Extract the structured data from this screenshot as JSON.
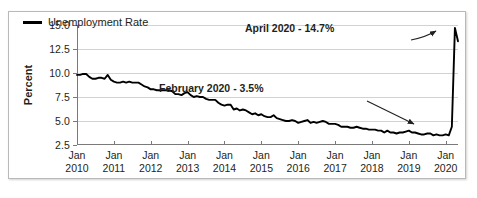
{
  "figure": {
    "legend": {
      "label": "Unemployment Rate",
      "swatch_color": "#000000"
    },
    "annotations": [
      {
        "id": "april",
        "text": "April 2020 - 14.7%"
      },
      {
        "id": "february",
        "text": "February 2020 - 3.5%"
      }
    ]
  },
  "chart_data": {
    "type": "line",
    "title": "",
    "xlabel": "",
    "ylabel": "Percent",
    "ylim": [
      2.5,
      15.0
    ],
    "yticks": [
      2.5,
      5.0,
      7.5,
      10.0,
      12.5,
      15.0
    ],
    "ytick_labels": [
      "2.5",
      "5.0",
      "7.5",
      "10.0",
      "12.5",
      "15.0"
    ],
    "grid": true,
    "legend_position": "top-left",
    "xtick_labels": [
      "Jan\n2010",
      "Jan\n2011",
      "Jan\n2012",
      "Jan\n2013",
      "Jan\n2014",
      "Jan\n2015",
      "Jan\n2016",
      "Jan\n2017",
      "Jan\n2018",
      "Jan\n2019",
      "Jan\n2020"
    ],
    "xticks_month": [
      "Jan",
      "Jan",
      "Jan",
      "Jan",
      "Jan",
      "Jan",
      "Jan",
      "Jan",
      "Jan",
      "Jan",
      "Jan"
    ],
    "xticks_year": [
      "2010",
      "2011",
      "2012",
      "2013",
      "2014",
      "2015",
      "2016",
      "2017",
      "2018",
      "2019",
      "2020"
    ],
    "xlim": [
      "2010-01",
      "2020-05"
    ],
    "annotations": [
      {
        "text": "April 2020 - 14.7%",
        "point": {
          "x": "2020-04",
          "y": 14.7
        }
      },
      {
        "text": "February 2020 - 3.5%",
        "point": {
          "x": "2020-02",
          "y": 3.5
        }
      }
    ],
    "series": [
      {
        "name": "Unemployment Rate",
        "color": "#000000",
        "x": [
          "2010-01",
          "2010-02",
          "2010-03",
          "2010-04",
          "2010-05",
          "2010-06",
          "2010-07",
          "2010-08",
          "2010-09",
          "2010-10",
          "2010-11",
          "2010-12",
          "2011-01",
          "2011-02",
          "2011-03",
          "2011-04",
          "2011-05",
          "2011-06",
          "2011-07",
          "2011-08",
          "2011-09",
          "2011-10",
          "2011-11",
          "2011-12",
          "2012-01",
          "2012-02",
          "2012-03",
          "2012-04",
          "2012-05",
          "2012-06",
          "2012-07",
          "2012-08",
          "2012-09",
          "2012-10",
          "2012-11",
          "2012-12",
          "2013-01",
          "2013-02",
          "2013-03",
          "2013-04",
          "2013-05",
          "2013-06",
          "2013-07",
          "2013-08",
          "2013-09",
          "2013-10",
          "2013-11",
          "2013-12",
          "2014-01",
          "2014-02",
          "2014-03",
          "2014-04",
          "2014-05",
          "2014-06",
          "2014-07",
          "2014-08",
          "2014-09",
          "2014-10",
          "2014-11",
          "2014-12",
          "2015-01",
          "2015-02",
          "2015-03",
          "2015-04",
          "2015-05",
          "2015-06",
          "2015-07",
          "2015-08",
          "2015-09",
          "2015-10",
          "2015-11",
          "2015-12",
          "2016-01",
          "2016-02",
          "2016-03",
          "2016-04",
          "2016-05",
          "2016-06",
          "2016-07",
          "2016-08",
          "2016-09",
          "2016-10",
          "2016-11",
          "2016-12",
          "2017-01",
          "2017-02",
          "2017-03",
          "2017-04",
          "2017-05",
          "2017-06",
          "2017-07",
          "2017-08",
          "2017-09",
          "2017-10",
          "2017-11",
          "2017-12",
          "2018-01",
          "2018-02",
          "2018-03",
          "2018-04",
          "2018-05",
          "2018-06",
          "2018-07",
          "2018-08",
          "2018-09",
          "2018-10",
          "2018-11",
          "2018-12",
          "2019-01",
          "2019-02",
          "2019-03",
          "2019-04",
          "2019-05",
          "2019-06",
          "2019-07",
          "2019-08",
          "2019-09",
          "2019-10",
          "2019-11",
          "2019-12",
          "2020-01",
          "2020-02",
          "2020-03",
          "2020-04",
          "2020-05"
        ],
        "values": [
          9.8,
          9.8,
          9.9,
          9.9,
          9.6,
          9.4,
          9.4,
          9.5,
          9.5,
          9.4,
          9.8,
          9.3,
          9.1,
          9.0,
          9.0,
          9.1,
          9.0,
          9.1,
          9.0,
          9.0,
          9.0,
          8.8,
          8.6,
          8.5,
          8.3,
          8.3,
          8.2,
          8.2,
          8.2,
          8.2,
          8.2,
          8.1,
          7.8,
          7.8,
          7.7,
          7.9,
          8.0,
          7.7,
          7.5,
          7.6,
          7.5,
          7.5,
          7.3,
          7.2,
          7.2,
          7.2,
          6.9,
          6.7,
          6.6,
          6.7,
          6.7,
          6.2,
          6.3,
          6.1,
          6.2,
          6.1,
          5.9,
          5.7,
          5.8,
          5.6,
          5.7,
          5.5,
          5.4,
          5.4,
          5.6,
          5.3,
          5.2,
          5.1,
          5.0,
          5.0,
          5.1,
          5.0,
          4.8,
          4.9,
          5.0,
          5.1,
          4.8,
          4.9,
          4.8,
          4.9,
          5.0,
          4.9,
          4.7,
          4.7,
          4.7,
          4.6,
          4.4,
          4.4,
          4.4,
          4.3,
          4.3,
          4.4,
          4.3,
          4.2,
          4.2,
          4.1,
          4.1,
          4.1,
          4.0,
          4.0,
          3.8,
          4.0,
          3.8,
          3.8,
          3.7,
          3.8,
          3.8,
          3.9,
          4.0,
          3.8,
          3.8,
          3.7,
          3.6,
          3.6,
          3.7,
          3.7,
          3.5,
          3.6,
          3.5,
          3.5,
          3.6,
          3.5,
          4.4,
          14.7,
          13.3
        ]
      }
    ]
  }
}
